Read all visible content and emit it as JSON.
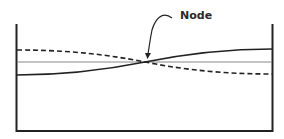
{
  "diagram": {
    "title": "",
    "annotation": {
      "label": "Node"
    },
    "elements": {
      "container": "open-top tank",
      "equilibrium_line": "thin horizontal line (still water level)",
      "wave_solid": "standing wave profile at one extreme",
      "wave_dashed": "standing wave profile at opposite extreme",
      "node_arrow": "curved arrow pointing to crossing point"
    },
    "colors": {
      "stroke": "#222222",
      "equilibrium": "#888888",
      "background": "#ffffff"
    }
  }
}
